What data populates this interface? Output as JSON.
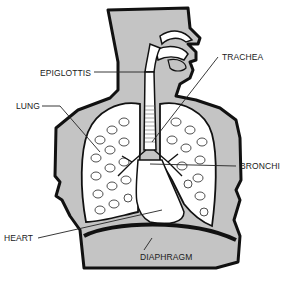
{
  "diagram": {
    "colors": {
      "body_fill": "#c4c4c4",
      "outline": "#111111",
      "background": "#ffffff",
      "organ_fill": "#ffffff"
    },
    "labels": [
      {
        "id": "epiglottis",
        "text": "EPIGLOTTIS"
      },
      {
        "id": "trachea",
        "text": "TRACHEA"
      },
      {
        "id": "lung",
        "text": "LUNG"
      },
      {
        "id": "bronchi",
        "text": "BRONCHI"
      },
      {
        "id": "heart",
        "text": "HEART"
      },
      {
        "id": "diaphragm",
        "text": "DIAPHRAGM"
      }
    ]
  }
}
